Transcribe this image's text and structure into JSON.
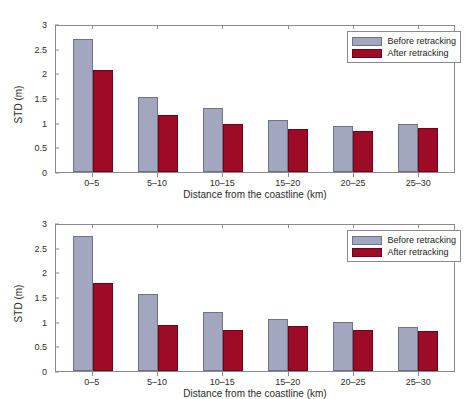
{
  "figures": [
    {
      "id": "top",
      "legend": {
        "before_label": "Before retracking",
        "after_label": "After retracking"
      },
      "chart_data": {
        "type": "bar",
        "title": "",
        "xlabel": "Distance from the coastline (km)",
        "ylabel": "STD (m)",
        "categories": [
          "0–5",
          "5–10",
          "10–15",
          "15–20",
          "20–25",
          "25–30"
        ],
        "series": [
          {
            "name": "Before retracking",
            "color": "#a3a6bf",
            "values": [
              2.7,
              1.53,
              1.29,
              1.05,
              0.94,
              0.98
            ]
          },
          {
            "name": "After retracking",
            "color": "#9e0b26",
            "values": [
              2.06,
              1.16,
              0.97,
              0.87,
              0.83,
              0.9
            ]
          }
        ],
        "ylim": [
          0,
          3
        ],
        "yticks": [
          "0",
          "0.5",
          "1",
          "1.5",
          "2",
          "2.5",
          "3"
        ],
        "ytick_values": [
          0,
          0.5,
          1,
          1.5,
          2,
          2.5,
          3
        ],
        "grid": false,
        "legend_position": "top-right"
      }
    },
    {
      "id": "bottom",
      "legend": {
        "before_label": "Before retracking",
        "after_label": "After retracking"
      },
      "chart_data": {
        "type": "bar",
        "title": "",
        "xlabel": "Distance from the coastline (km)",
        "ylabel": "STD (m)",
        "categories": [
          "0–5",
          "5–10",
          "10–15",
          "15–20",
          "20–25",
          "25–30"
        ],
        "series": [
          {
            "name": "Before retracking",
            "color": "#a3a6bf",
            "values": [
              2.73,
              1.57,
              1.2,
              1.06,
              0.99,
              0.89
            ]
          },
          {
            "name": "After retracking",
            "color": "#9e0b26",
            "values": [
              1.79,
              0.94,
              0.84,
              0.92,
              0.84,
              0.82
            ]
          }
        ],
        "ylim": [
          0,
          3
        ],
        "yticks": [
          "0",
          "0.5",
          "1",
          "1.5",
          "2",
          "2.5",
          "3"
        ],
        "ytick_values": [
          0,
          0.5,
          1,
          1.5,
          2,
          2.5,
          3
        ],
        "grid": false,
        "legend_position": "top-right"
      }
    }
  ]
}
